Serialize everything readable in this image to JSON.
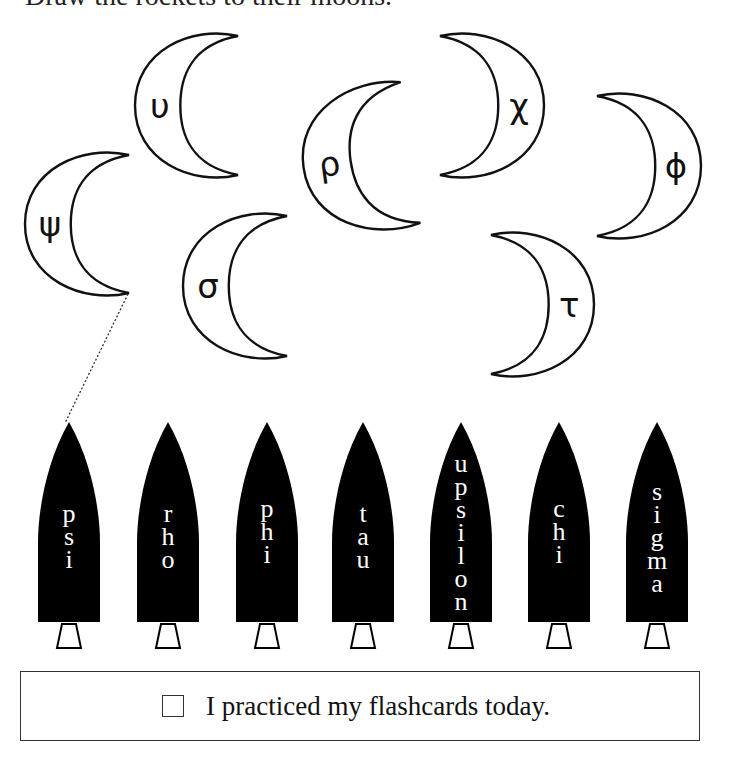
{
  "worksheet": {
    "instruction": "Draw the rockets to their moons."
  },
  "moons": [
    {
      "id": "upsilon",
      "symbol": "υ",
      "x": 135,
      "y": 33,
      "w": 103,
      "h": 145,
      "opens": "right",
      "rotate": 0
    },
    {
      "id": "psi",
      "symbol": "ψ",
      "x": 25,
      "y": 152,
      "w": 104,
      "h": 144,
      "opens": "right",
      "rotate": 0
    },
    {
      "id": "rho",
      "symbol": "ρ",
      "x": 303,
      "y": 86,
      "w": 108,
      "h": 148,
      "opens": "right",
      "rotate": -8
    },
    {
      "id": "chi",
      "symbol": "χ",
      "x": 440,
      "y": 33,
      "w": 104,
      "h": 145,
      "opens": "left",
      "rotate": 0
    },
    {
      "id": "phi",
      "symbol": "ϕ",
      "x": 597,
      "y": 93,
      "w": 104,
      "h": 146,
      "opens": "left",
      "rotate": 0
    },
    {
      "id": "sigma",
      "symbol": "σ",
      "x": 183,
      "y": 213,
      "w": 104,
      "h": 146,
      "opens": "right",
      "rotate": 0
    },
    {
      "id": "tau",
      "symbol": "τ",
      "x": 491,
      "y": 232,
      "w": 103,
      "h": 145,
      "opens": "left",
      "rotate": 0
    }
  ],
  "rockets": [
    {
      "id": "psi",
      "name": "psi",
      "x": 38,
      "text_top": 80
    },
    {
      "id": "rho",
      "name": "rho",
      "x": 137,
      "text_top": 80
    },
    {
      "id": "phi",
      "name": "phi",
      "x": 236,
      "text_top": 75
    },
    {
      "id": "tau",
      "name": "tau",
      "x": 332,
      "text_top": 80
    },
    {
      "id": "upsilon",
      "name": "upsilon",
      "x": 430,
      "text_top": 30
    },
    {
      "id": "chi",
      "name": "chi",
      "x": 528,
      "text_top": 75
    },
    {
      "id": "sigma",
      "name": "sigma",
      "x": 626,
      "text_top": 58
    }
  ],
  "connection": {
    "from_moon": "psi",
    "to_rocket": "psi",
    "x1": 128,
    "y1": 294,
    "x2": 65,
    "y2": 423
  },
  "practice": {
    "checked": false,
    "label": "I practiced my flashcards today."
  },
  "colors": {
    "rocket_fill": "#000000",
    "moon_stroke": "#111111",
    "rocket_text": "#ffffff"
  }
}
